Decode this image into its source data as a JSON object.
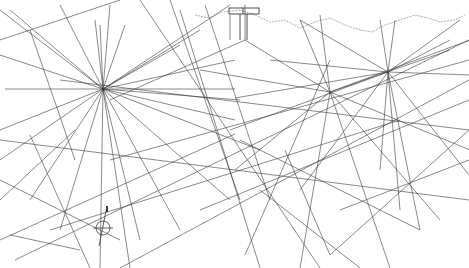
{
  "image": {
    "description": "Hand-drawn rhumb-line chart sketch with radiating line networks and coastline outline",
    "width": 469,
    "height": 268,
    "background": "#ffffff",
    "line_color": "#3a3a3a",
    "coast_color": "#9a9a9a"
  },
  "coastline": "M195,15 L210,18 L222,12 L240,10 L255,15 L270,22 L285,20 L300,28 L315,22 L330,18 L345,25 L360,30 L372,32 L385,25 L400,20 L415,15 L428,18 L440,22 L455,20 L465,15",
  "hubs": [
    {
      "name": "west-hub",
      "x": 103,
      "y": 89
    },
    {
      "name": "central-hub",
      "x": 330,
      "y": 92
    },
    {
      "name": "east-hub",
      "x": 388,
      "y": 72
    }
  ],
  "lines": [
    [
      0,
      10,
      103,
      89
    ],
    [
      10,
      10,
      103,
      89
    ],
    [
      30,
      30,
      75,
      160
    ],
    [
      60,
      5,
      103,
      89
    ],
    [
      95,
      20,
      103,
      89
    ],
    [
      100,
      25,
      103,
      89
    ],
    [
      125,
      25,
      103,
      89
    ],
    [
      110,
      5,
      103,
      89
    ],
    [
      0,
      55,
      103,
      89
    ],
    [
      5,
      89,
      235,
      89
    ],
    [
      0,
      130,
      103,
      89
    ],
    [
      0,
      160,
      103,
      89
    ],
    [
      30,
      200,
      103,
      89
    ],
    [
      60,
      230,
      103,
      89
    ],
    [
      100,
      268,
      103,
      89
    ],
    [
      130,
      268,
      103,
      89
    ],
    [
      140,
      240,
      103,
      89
    ],
    [
      180,
      230,
      103,
      89
    ],
    [
      230,
      200,
      103,
      89
    ],
    [
      260,
      150,
      103,
      89
    ],
    [
      235,
      120,
      103,
      89
    ],
    [
      235,
      60,
      103,
      89
    ],
    [
      200,
      30,
      103,
      89
    ],
    [
      230,
      5,
      103,
      89
    ],
    [
      180,
      45,
      103,
      89
    ],
    [
      240,
      100,
      103,
      89
    ],
    [
      0,
      180,
      120,
      240
    ],
    [
      10,
      235,
      80,
      250
    ],
    [
      0,
      200,
      75,
      130
    ],
    [
      30,
      135,
      90,
      268
    ],
    [
      205,
      5,
      270,
      200
    ],
    [
      230,
      15,
      230,
      40
    ],
    [
      245,
      5,
      245,
      40
    ],
    [
      245,
      40,
      330,
      92
    ],
    [
      245,
      40,
      110,
      100
    ],
    [
      300,
      20,
      330,
      92
    ],
    [
      320,
      15,
      330,
      92
    ],
    [
      380,
      20,
      388,
      72
    ],
    [
      395,
      20,
      388,
      72
    ],
    [
      330,
      92,
      470,
      40
    ],
    [
      330,
      92,
      470,
      150
    ],
    [
      330,
      92,
      235,
      170
    ],
    [
      330,
      92,
      300,
      268
    ],
    [
      330,
      92,
      390,
      268
    ],
    [
      330,
      92,
      440,
      220
    ],
    [
      330,
      92,
      200,
      70
    ],
    [
      330,
      92,
      450,
      50
    ],
    [
      388,
      72,
      235,
      98
    ],
    [
      388,
      72,
      270,
      60
    ],
    [
      388,
      72,
      470,
      75
    ],
    [
      388,
      72,
      469,
      175
    ],
    [
      388,
      72,
      400,
      210
    ],
    [
      388,
      72,
      420,
      230
    ],
    [
      388,
      72,
      300,
      190
    ],
    [
      388,
      72,
      230,
      130
    ],
    [
      388,
      72,
      300,
      20
    ],
    [
      388,
      72,
      450,
      40
    ],
    [
      388,
      72,
      380,
      170
    ],
    [
      388,
      72,
      460,
      20
    ],
    [
      140,
      0,
      320,
      268
    ],
    [
      170,
      0,
      240,
      200
    ],
    [
      180,
      10,
      260,
      268
    ],
    [
      0,
      240,
      235,
      134
    ],
    [
      15,
      260,
      469,
      40
    ],
    [
      50,
      230,
      400,
      120
    ],
    [
      120,
      268,
      469,
      80
    ],
    [
      110,
      160,
      469,
      60
    ],
    [
      200,
      210,
      469,
      100
    ],
    [
      245,
      255,
      330,
      60
    ],
    [
      330,
      255,
      469,
      130
    ],
    [
      340,
      210,
      469,
      160
    ],
    [
      0,
      40,
      120,
      0
    ],
    [
      0,
      140,
      469,
      200
    ],
    [
      60,
      80,
      469,
      130
    ],
    [
      240,
      140,
      420,
      230
    ],
    [
      260,
      190,
      360,
      268
    ],
    [
      285,
      150,
      330,
      255
    ]
  ],
  "compass": {
    "x": 103,
    "y": 228,
    "r": 7
  }
}
